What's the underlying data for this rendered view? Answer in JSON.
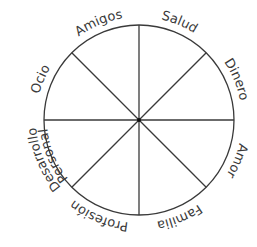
{
  "diagram": {
    "type": "wheel-of-life",
    "segments": [
      {
        "label": "Salud"
      },
      {
        "label": "Dinero"
      },
      {
        "label": "Amor"
      },
      {
        "label": "Familia"
      },
      {
        "label": "Profesión"
      },
      {
        "label": "Desarrollo",
        "label2": "Personal"
      },
      {
        "label": "Ocio"
      },
      {
        "label": "Amigos"
      }
    ],
    "colors": {
      "line": "#3a3a3a",
      "background": "#ffffff"
    }
  }
}
